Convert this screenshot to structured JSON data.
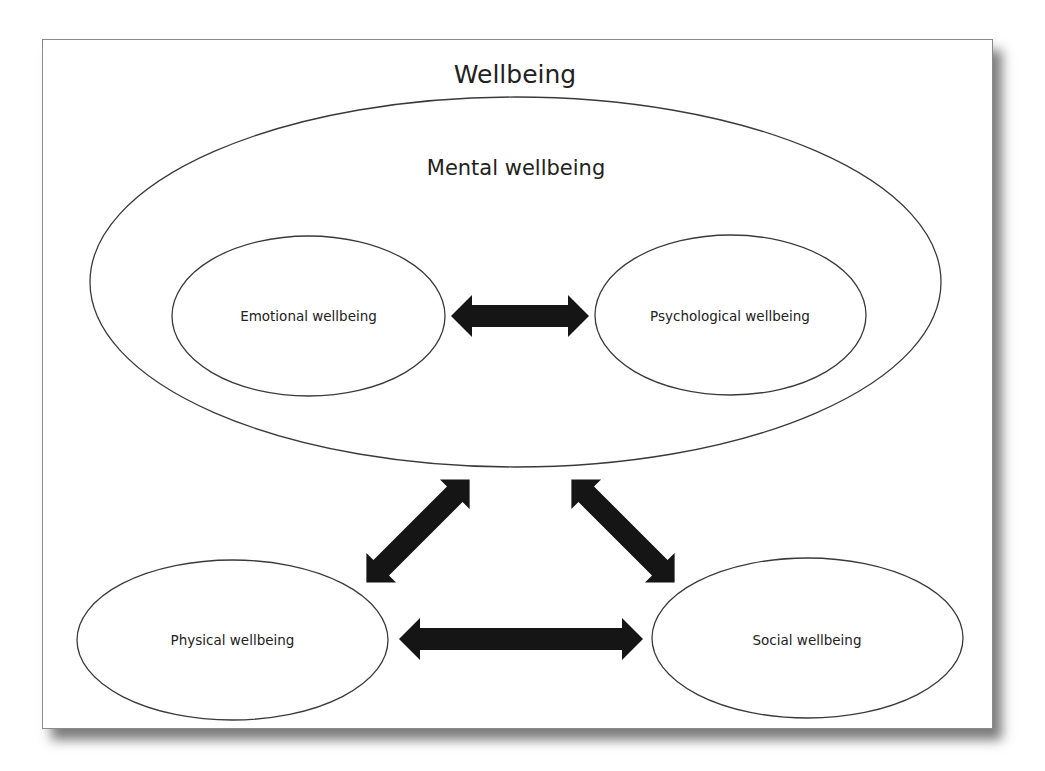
{
  "diagram": {
    "title": "Wellbeing",
    "container": {
      "label": "Mental wellbeing",
      "children": [
        {
          "id": "emotional",
          "label": "Emotional wellbeing"
        },
        {
          "id": "psychological",
          "label": "Psychological wellbeing"
        }
      ]
    },
    "nodes": [
      {
        "id": "physical",
        "label": "Physical wellbeing"
      },
      {
        "id": "social",
        "label": "Social wellbeing"
      }
    ],
    "edges": [
      {
        "from": "emotional",
        "to": "psychological",
        "type": "bidirectional"
      },
      {
        "from": "mental",
        "to": "physical",
        "type": "bidirectional"
      },
      {
        "from": "mental",
        "to": "social",
        "type": "bidirectional"
      },
      {
        "from": "physical",
        "to": "social",
        "type": "bidirectional"
      }
    ],
    "colors": {
      "stroke": "#3a3a3a",
      "arrow": "#151515",
      "frame_border": "#8a8a8a",
      "background": "#ffffff"
    }
  }
}
